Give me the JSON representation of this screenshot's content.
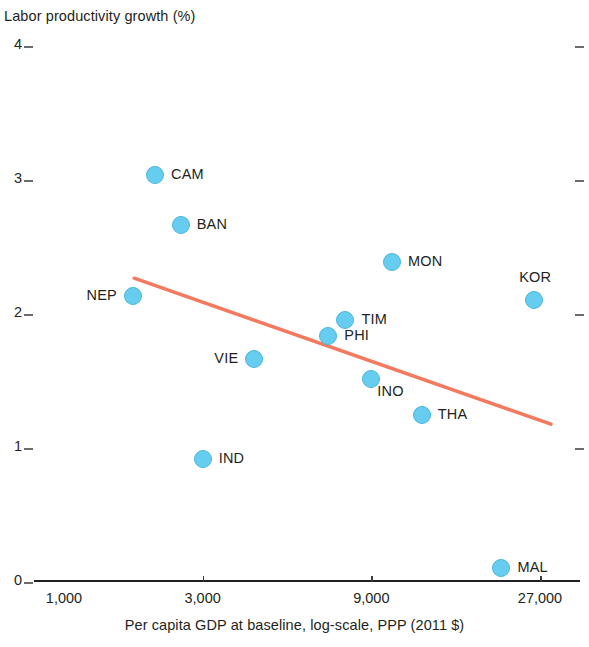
{
  "chart_data": {
    "type": "scatter",
    "title": "Labor productivity growth (%)",
    "xlabel": "Per capita GDP at baseline, log-scale, PPP (2011 $)",
    "ylabel": "Labor productivity growth (%)",
    "x_scale": "log",
    "xlim": [
      1000,
      32000
    ],
    "ylim": [
      0,
      4.2
    ],
    "grid": false,
    "legend": null,
    "x_tick_labels": [
      "1,000",
      "3,000",
      "9,000",
      "27,000"
    ],
    "x_tick_values": [
      1000,
      3000,
      9000,
      27000
    ],
    "y_tick_labels": [
      "0",
      "1",
      "2",
      "3",
      "4"
    ],
    "y_tick_values": [
      0,
      1,
      2,
      3,
      4
    ],
    "point_color": "#67cdf0",
    "trendline_color": "#f4795f",
    "points": [
      {
        "label": "CAM",
        "x": 2200,
        "y": 3.03,
        "label_pos": "right"
      },
      {
        "label": "BAN",
        "x": 2600,
        "y": 2.66,
        "label_pos": "right"
      },
      {
        "label": "MON",
        "x": 10300,
        "y": 2.38,
        "label_pos": "right"
      },
      {
        "label": "KOR",
        "x": 26000,
        "y": 2.1,
        "label_pos": "above"
      },
      {
        "label": "NEP",
        "x": 1900,
        "y": 2.13,
        "label_pos": "left"
      },
      {
        "label": "TIM",
        "x": 7600,
        "y": 1.95,
        "label_pos": "right"
      },
      {
        "label": "PHI",
        "x": 6800,
        "y": 1.83,
        "label_pos": "right"
      },
      {
        "label": "VIE",
        "x": 4200,
        "y": 1.66,
        "label_pos": "left"
      },
      {
        "label": "INO",
        "x": 9000,
        "y": 1.51,
        "label_pos": "below-right"
      },
      {
        "label": "THA",
        "x": 12500,
        "y": 1.24,
        "label_pos": "right"
      },
      {
        "label": "IND",
        "x": 3000,
        "y": 0.91,
        "label_pos": "right"
      },
      {
        "label": "MAL",
        "x": 21000,
        "y": 0.1,
        "label_pos": "right"
      }
    ],
    "trendline": {
      "x_start": 1920,
      "y_start": 2.26,
      "x_end": 29000,
      "y_end": 1.17
    }
  }
}
